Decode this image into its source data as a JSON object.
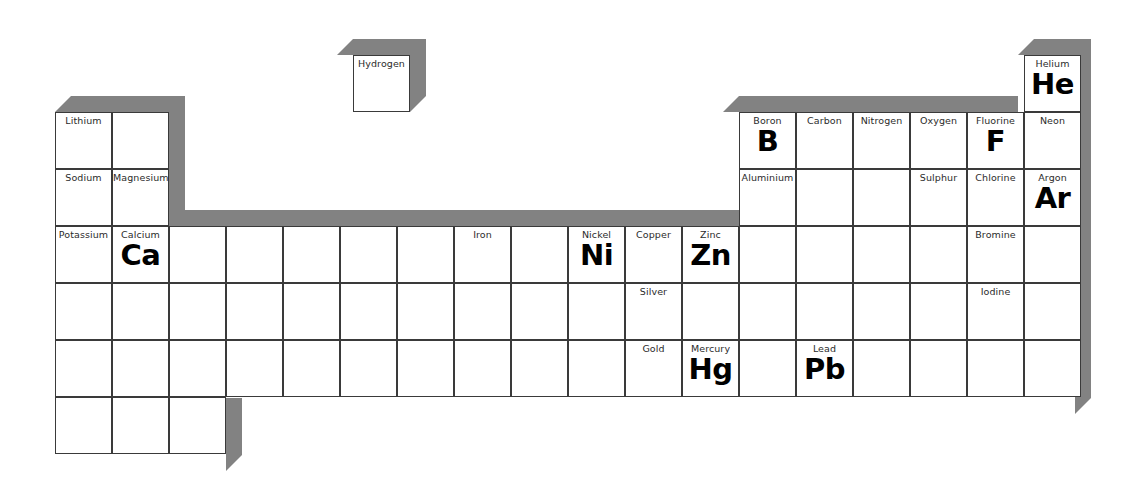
{
  "document": {
    "title": "Periodic Table Worksheet",
    "kind": "blank periodic table grid with selected element names and symbols"
  },
  "grid": {
    "columns": 18,
    "rows": 7,
    "cell_width": 57,
    "cell_height": 57,
    "origin_x": 55,
    "origin_y": 55,
    "cell_fill": "#ffffff",
    "cell_border": "#3a3a3a",
    "extrusion_color": "#828282",
    "extrusion_depth": 16
  },
  "elements": [
    {
      "key": "hydrogen",
      "name": "Hydrogen",
      "symbol": "",
      "row": 1,
      "col": 1,
      "floating": true
    },
    {
      "key": "helium",
      "name": "Helium",
      "symbol": "He",
      "row": 1,
      "col": 18,
      "floating": false
    },
    {
      "key": "lithium",
      "name": "Lithium",
      "symbol": "",
      "row": 2,
      "col": 1,
      "floating": false
    },
    {
      "key": "beryllium",
      "name": "",
      "symbol": "",
      "row": 2,
      "col": 2,
      "floating": false
    },
    {
      "key": "boron",
      "name": "Boron",
      "symbol": "B",
      "row": 2,
      "col": 13,
      "floating": false
    },
    {
      "key": "carbon",
      "name": "Carbon",
      "symbol": "",
      "row": 2,
      "col": 14,
      "floating": false
    },
    {
      "key": "nitrogen",
      "name": "Nitrogen",
      "symbol": "",
      "row": 2,
      "col": 15,
      "floating": false
    },
    {
      "key": "oxygen",
      "name": "Oxygen",
      "symbol": "",
      "row": 2,
      "col": 16,
      "floating": false
    },
    {
      "key": "fluorine",
      "name": "Fluorine",
      "symbol": "F",
      "row": 2,
      "col": 17,
      "floating": false
    },
    {
      "key": "neon",
      "name": "Neon",
      "symbol": "",
      "row": 2,
      "col": 18,
      "floating": false
    },
    {
      "key": "sodium",
      "name": "Sodium",
      "symbol": "",
      "row": 3,
      "col": 1,
      "floating": false
    },
    {
      "key": "magnesium",
      "name": "Magnesium",
      "symbol": "",
      "row": 3,
      "col": 2,
      "floating": false
    },
    {
      "key": "aluminium",
      "name": "Aluminium",
      "symbol": "",
      "row": 3,
      "col": 13,
      "floating": false
    },
    {
      "key": "silicon",
      "name": "",
      "symbol": "",
      "row": 3,
      "col": 14,
      "floating": false
    },
    {
      "key": "phosphorus",
      "name": "",
      "symbol": "",
      "row": 3,
      "col": 15,
      "floating": false
    },
    {
      "key": "sulphur",
      "name": "Sulphur",
      "symbol": "",
      "row": 3,
      "col": 16,
      "floating": false
    },
    {
      "key": "chlorine",
      "name": "Chlorine",
      "symbol": "",
      "row": 3,
      "col": 17,
      "floating": false
    },
    {
      "key": "argon",
      "name": "Argon",
      "symbol": "Ar",
      "row": 3,
      "col": 18,
      "floating": false
    },
    {
      "key": "potassium",
      "name": "Potassium",
      "symbol": "",
      "row": 4,
      "col": 1,
      "floating": false
    },
    {
      "key": "calcium",
      "name": "Calcium",
      "symbol": "Ca",
      "row": 4,
      "col": 2,
      "floating": false
    },
    {
      "key": "scandium",
      "name": "",
      "symbol": "",
      "row": 4,
      "col": 3,
      "floating": false
    },
    {
      "key": "titanium",
      "name": "",
      "symbol": "",
      "row": 4,
      "col": 4,
      "floating": false
    },
    {
      "key": "vanadium",
      "name": "",
      "symbol": "",
      "row": 4,
      "col": 5,
      "floating": false
    },
    {
      "key": "chromium",
      "name": "",
      "symbol": "",
      "row": 4,
      "col": 6,
      "floating": false
    },
    {
      "key": "manganese",
      "name": "",
      "symbol": "",
      "row": 4,
      "col": 7,
      "floating": false
    },
    {
      "key": "iron",
      "name": "Iron",
      "symbol": "",
      "row": 4,
      "col": 8,
      "floating": false
    },
    {
      "key": "cobalt",
      "name": "",
      "symbol": "",
      "row": 4,
      "col": 9,
      "floating": false
    },
    {
      "key": "nickel",
      "name": "Nickel",
      "symbol": "Ni",
      "row": 4,
      "col": 10,
      "floating": false
    },
    {
      "key": "copper",
      "name": "Copper",
      "symbol": "",
      "row": 4,
      "col": 11,
      "floating": false
    },
    {
      "key": "zinc",
      "name": "Zinc",
      "symbol": "Zn",
      "row": 4,
      "col": 12,
      "floating": false
    },
    {
      "key": "gallium",
      "name": "",
      "symbol": "",
      "row": 4,
      "col": 13,
      "floating": false
    },
    {
      "key": "germanium",
      "name": "",
      "symbol": "",
      "row": 4,
      "col": 14,
      "floating": false
    },
    {
      "key": "arsenic",
      "name": "",
      "symbol": "",
      "row": 4,
      "col": 15,
      "floating": false
    },
    {
      "key": "selenium",
      "name": "",
      "symbol": "",
      "row": 4,
      "col": 16,
      "floating": false
    },
    {
      "key": "bromine",
      "name": "Bromine",
      "symbol": "",
      "row": 4,
      "col": 17,
      "floating": false
    },
    {
      "key": "krypton",
      "name": "",
      "symbol": "",
      "row": 4,
      "col": 18,
      "floating": false
    },
    {
      "key": "rubidium",
      "name": "",
      "symbol": "",
      "row": 5,
      "col": 1,
      "floating": false
    },
    {
      "key": "strontium",
      "name": "",
      "symbol": "",
      "row": 5,
      "col": 2,
      "floating": false
    },
    {
      "key": "yttrium",
      "name": "",
      "symbol": "",
      "row": 5,
      "col": 3,
      "floating": false
    },
    {
      "key": "zirconium",
      "name": "",
      "symbol": "",
      "row": 5,
      "col": 4,
      "floating": false
    },
    {
      "key": "niobium",
      "name": "",
      "symbol": "",
      "row": 5,
      "col": 5,
      "floating": false
    },
    {
      "key": "molybdenum",
      "name": "",
      "symbol": "",
      "row": 5,
      "col": 6,
      "floating": false
    },
    {
      "key": "technetium",
      "name": "",
      "symbol": "",
      "row": 5,
      "col": 7,
      "floating": false
    },
    {
      "key": "ruthenium",
      "name": "",
      "symbol": "",
      "row": 5,
      "col": 8,
      "floating": false
    },
    {
      "key": "rhodium",
      "name": "",
      "symbol": "",
      "row": 5,
      "col": 9,
      "floating": false
    },
    {
      "key": "palladium",
      "name": "",
      "symbol": "",
      "row": 5,
      "col": 10,
      "floating": false
    },
    {
      "key": "silver",
      "name": "Silver",
      "symbol": "",
      "row": 5,
      "col": 11,
      "floating": false
    },
    {
      "key": "cadmium",
      "name": "",
      "symbol": "",
      "row": 5,
      "col": 12,
      "floating": false
    },
    {
      "key": "indium",
      "name": "",
      "symbol": "",
      "row": 5,
      "col": 13,
      "floating": false
    },
    {
      "key": "tin",
      "name": "",
      "symbol": "",
      "row": 5,
      "col": 14,
      "floating": false
    },
    {
      "key": "antimony",
      "name": "",
      "symbol": "",
      "row": 5,
      "col": 15,
      "floating": false
    },
    {
      "key": "tellurium",
      "name": "",
      "symbol": "",
      "row": 5,
      "col": 16,
      "floating": false
    },
    {
      "key": "iodine",
      "name": "Iodine",
      "symbol": "",
      "row": 5,
      "col": 17,
      "floating": false
    },
    {
      "key": "xenon",
      "name": "",
      "symbol": "",
      "row": 5,
      "col": 18,
      "floating": false
    },
    {
      "key": "caesium",
      "name": "",
      "symbol": "",
      "row": 6,
      "col": 1,
      "floating": false
    },
    {
      "key": "barium",
      "name": "",
      "symbol": "",
      "row": 6,
      "col": 2,
      "floating": false
    },
    {
      "key": "lanthanum",
      "name": "",
      "symbol": "",
      "row": 6,
      "col": 3,
      "floating": false
    },
    {
      "key": "hafnium",
      "name": "",
      "symbol": "",
      "row": 6,
      "col": 4,
      "floating": false
    },
    {
      "key": "tantalum",
      "name": "",
      "symbol": "",
      "row": 6,
      "col": 5,
      "floating": false
    },
    {
      "key": "tungsten",
      "name": "",
      "symbol": "",
      "row": 6,
      "col": 6,
      "floating": false
    },
    {
      "key": "rhenium",
      "name": "",
      "symbol": "",
      "row": 6,
      "col": 7,
      "floating": false
    },
    {
      "key": "osmium",
      "name": "",
      "symbol": "",
      "row": 6,
      "col": 8,
      "floating": false
    },
    {
      "key": "iridium",
      "name": "",
      "symbol": "",
      "row": 6,
      "col": 9,
      "floating": false
    },
    {
      "key": "platinum",
      "name": "",
      "symbol": "",
      "row": 6,
      "col": 10,
      "floating": false
    },
    {
      "key": "gold",
      "name": "Gold",
      "symbol": "",
      "row": 6,
      "col": 11,
      "floating": false
    },
    {
      "key": "mercury",
      "name": "Mercury",
      "symbol": "Hg",
      "row": 6,
      "col": 12,
      "floating": false
    },
    {
      "key": "thallium",
      "name": "",
      "symbol": "",
      "row": 6,
      "col": 13,
      "floating": false
    },
    {
      "key": "lead",
      "name": "Lead",
      "symbol": "Pb",
      "row": 6,
      "col": 14,
      "floating": false
    },
    {
      "key": "bismuth",
      "name": "",
      "symbol": "",
      "row": 6,
      "col": 15,
      "floating": false
    },
    {
      "key": "polonium",
      "name": "",
      "symbol": "",
      "row": 6,
      "col": 16,
      "floating": false
    },
    {
      "key": "astatine",
      "name": "",
      "symbol": "",
      "row": 6,
      "col": 17,
      "floating": false
    },
    {
      "key": "radon",
      "name": "",
      "symbol": "",
      "row": 6,
      "col": 18,
      "floating": false
    },
    {
      "key": "francium",
      "name": "",
      "symbol": "",
      "row": 7,
      "col": 1,
      "floating": false
    },
    {
      "key": "radium",
      "name": "",
      "symbol": "",
      "row": 7,
      "col": 2,
      "floating": false
    },
    {
      "key": "actinium",
      "name": "",
      "symbol": "",
      "row": 7,
      "col": 3,
      "floating": false
    }
  ]
}
